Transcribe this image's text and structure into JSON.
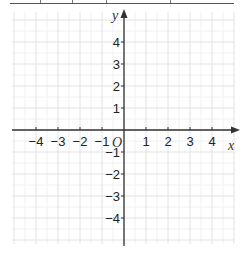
{
  "chart_data": {
    "type": "coordinate-plane",
    "title": "",
    "xlabel": "x",
    "ylabel": "y",
    "origin_label": "O",
    "xlim": [
      -5,
      5
    ],
    "ylim": [
      -5,
      5
    ],
    "grid": true,
    "x_ticks": [
      -4,
      -3,
      -2,
      -1,
      1,
      2,
      3,
      4
    ],
    "y_ticks": [
      4,
      3,
      2,
      1,
      -1,
      -2,
      -3,
      -4
    ],
    "x_tick_labels": [
      "−4",
      "−3",
      "−2",
      "−1",
      "1",
      "2",
      "3",
      "4"
    ],
    "y_tick_labels": [
      "4",
      "3",
      "2",
      "1",
      "−1",
      "−2",
      "−3",
      "−4"
    ],
    "series": []
  },
  "colors": {
    "axis": "#333333",
    "grid_major": "#e2e2e2",
    "grid_minor": "#f0f0f0",
    "text": "#222222"
  }
}
